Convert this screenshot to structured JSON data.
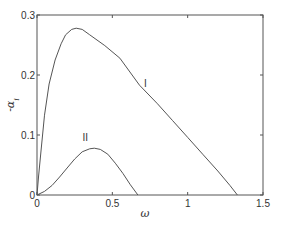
{
  "chart_data": {
    "type": "line",
    "title": "",
    "xlabel": "ω",
    "ylabel": "-α_i",
    "xlim": [
      0,
      1.5
    ],
    "ylim": [
      0,
      0.3
    ],
    "xticks": [
      0,
      0.5,
      1,
      1.5
    ],
    "xtick_labels": [
      "0",
      "0.5",
      "1",
      "1.5"
    ],
    "yticks": [
      0,
      0.1,
      0.2,
      0.3
    ],
    "ytick_labels": [
      "0",
      "0.1",
      "0.2",
      "0.3"
    ],
    "grid": false,
    "legend": "none (inline curve labels)",
    "series": [
      {
        "name": "I",
        "x": [
          0,
          0.01,
          0.027,
          0.05,
          0.08,
          0.12,
          0.16,
          0.19,
          0.23,
          0.26,
          0.3,
          0.35,
          0.45,
          0.55,
          0.68,
          0.8,
          0.9,
          1.0,
          1.1,
          1.2,
          1.28,
          1.33
        ],
        "y": [
          0,
          0.03,
          0.075,
          0.133,
          0.185,
          0.225,
          0.252,
          0.267,
          0.276,
          0.278,
          0.276,
          0.267,
          0.249,
          0.228,
          0.183,
          0.152,
          0.124,
          0.096,
          0.068,
          0.04,
          0.016,
          0
        ]
      },
      {
        "name": "II",
        "x": [
          0,
          0.05,
          0.1,
          0.15,
          0.2,
          0.25,
          0.3,
          0.35,
          0.38,
          0.42,
          0.47,
          0.52,
          0.57,
          0.62,
          0.67
        ],
        "y": [
          0,
          0.006,
          0.016,
          0.03,
          0.045,
          0.06,
          0.072,
          0.077,
          0.078,
          0.076,
          0.068,
          0.053,
          0.036,
          0.017,
          0
        ]
      }
    ],
    "annotations": [
      {
        "text": "I",
        "x": 0.72,
        "y": 0.18
      },
      {
        "text": "II",
        "x": 0.32,
        "y": 0.09
      }
    ]
  },
  "colors": {
    "axis": "#555555",
    "curve": "#555555",
    "text": "#333333"
  }
}
